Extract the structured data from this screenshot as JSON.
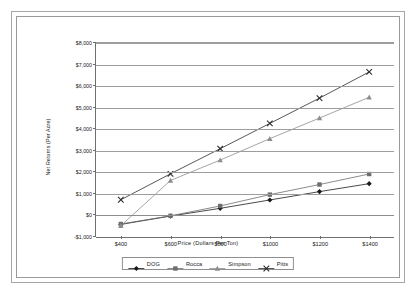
{
  "chart_data": {
    "type": "line",
    "title": "",
    "xlabel": "Price (Dollars Per Ton)",
    "ylabel": "Net Returns (Per Acre)",
    "x": [
      400,
      600,
      800,
      1000,
      1200,
      1400
    ],
    "x_tick_labels": [
      "$400",
      "$600",
      "$800",
      "$1000",
      "$1200",
      "$1400"
    ],
    "y_tick_labels": [
      "$8,000",
      "$7,000",
      "$6,000",
      "$5,000",
      "$4,000",
      "$3,000",
      "$2,000",
      "$1,000",
      "$0",
      "-$1,000"
    ],
    "y_tick_values": [
      8000,
      7000,
      6000,
      5000,
      4000,
      3000,
      2000,
      1000,
      0,
      -1000
    ],
    "ylim": [
      -1000,
      8000
    ],
    "xlim": [
      300,
      1500
    ],
    "grid": true,
    "legend_position": "bottom",
    "series": [
      {
        "name": "DOG",
        "marker": "diamond",
        "color": "#1a1a1a",
        "values": [
          -460,
          -70,
          290,
          680,
          1070,
          1440
        ]
      },
      {
        "name": "Rocca",
        "marker": "square",
        "color": "#6d6d6d",
        "values": [
          -440,
          -60,
          400,
          930,
          1400,
          1890
        ]
      },
      {
        "name": "Simpson",
        "marker": "triangle",
        "color": "#8d8d8d",
        "values": [
          -520,
          1590,
          2540,
          3540,
          4500,
          5470
        ]
      },
      {
        "name": "Pitts",
        "marker": "cross-x",
        "color": "#2b2b2b",
        "values": [
          690,
          1900,
          3070,
          4250,
          5430,
          6650
        ]
      }
    ]
  },
  "legend": {
    "entries": [
      {
        "label": "DOG"
      },
      {
        "label": "Rocca"
      },
      {
        "label": "Simpson"
      },
      {
        "label": "Pitts"
      }
    ]
  }
}
